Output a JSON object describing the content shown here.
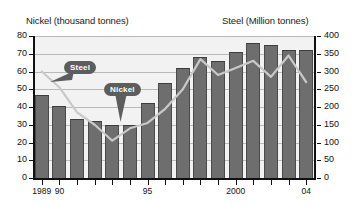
{
  "chart_data": {
    "type": "bar",
    "title": "",
    "left_axis": {
      "label": "Nickel (thousand tonnes)",
      "ticks": [
        0,
        10,
        20,
        30,
        40,
        50,
        60,
        70,
        80
      ],
      "ylim": [
        0,
        80
      ]
    },
    "right_axis": {
      "label": "Steel (Million tonnes)",
      "ticks": [
        0,
        50,
        100,
        150,
        200,
        250,
        300,
        350,
        400
      ],
      "ylim": [
        0,
        400
      ]
    },
    "categories": [
      "1989",
      "90",
      "91",
      "92",
      "93",
      "94",
      "95",
      "96",
      "97",
      "98",
      "99",
      "2000",
      "01",
      "02",
      "03",
      "04"
    ],
    "tick_labels_shown": [
      "1989",
      "90",
      "95",
      "2000",
      "04"
    ],
    "grid": true,
    "legend_position": "inline-callouts",
    "series": [
      {
        "name": "Nickel",
        "type": "bar",
        "axis": "left",
        "unit": "thousand tonnes",
        "color": "#6e6e6e",
        "values": [
          46.5,
          40.5,
          33.0,
          32.0,
          30.0,
          29.8,
          42.5,
          53.5,
          61.8,
          68.0,
          66.2,
          71.0,
          76.0,
          75.0,
          72.2,
          72.2
        ]
      },
      {
        "name": "Steel",
        "type": "line",
        "axis": "right",
        "unit": "Million tonnes",
        "color": "#c9c9c9",
        "values": [
          300,
          255,
          185,
          150,
          105,
          140,
          155,
          195,
          250,
          335,
          290,
          310,
          330,
          285,
          345,
          270
        ]
      }
    ],
    "annotations": [
      {
        "name": "Steel",
        "label": "Steel",
        "points_to": "steel-line"
      },
      {
        "name": "Nickel",
        "label": "Nickel",
        "points_to": "nickel-bars"
      }
    ]
  }
}
